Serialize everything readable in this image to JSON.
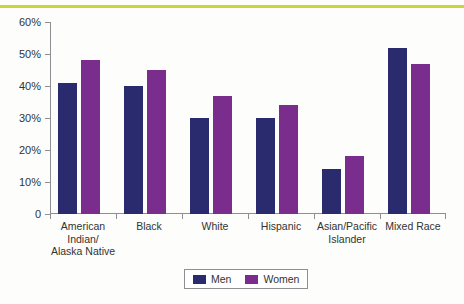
{
  "chart_data": {
    "type": "bar",
    "title": "",
    "xlabel": "",
    "ylabel": "",
    "ylim": [
      0,
      60
    ],
    "ytick_labels": [
      "0",
      "10%",
      "20%",
      "30%",
      "40%",
      "50%",
      "60%"
    ],
    "ytick_values": [
      0,
      10,
      20,
      30,
      40,
      50,
      60
    ],
    "grid": false,
    "legend_position": "bottom-center",
    "categories": [
      "American Indian/ Alaska Native",
      "Black",
      "White",
      "Hispanic",
      "Asian/Pacific Islander",
      "Mixed Race"
    ],
    "category_lines": [
      [
        "American",
        "Indian/",
        "Alaska Native"
      ],
      [
        "Black"
      ],
      [
        "White"
      ],
      [
        "Hispanic"
      ],
      [
        "Asian/Pacific",
        "Islander"
      ],
      [
        "Mixed Race"
      ]
    ],
    "series": [
      {
        "name": "Men",
        "color": "#2a2a6e",
        "values": [
          41,
          40,
          30,
          30,
          14,
          52
        ]
      },
      {
        "name": "Women",
        "color": "#7b2d8e",
        "values": [
          48,
          45,
          37,
          34,
          18,
          47
        ]
      }
    ]
  },
  "decoration": {
    "top_rule_color": "#ccd633",
    "axis_color": "#8e8e93"
  }
}
